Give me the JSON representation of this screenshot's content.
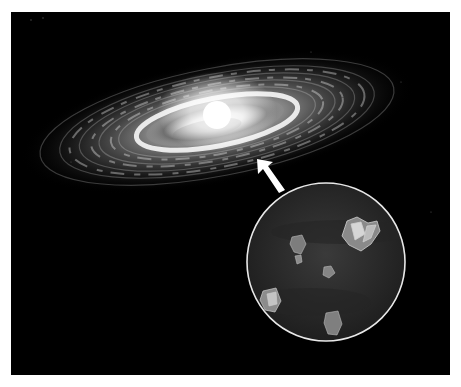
{
  "figure": {
    "background_color": "#000000",
    "inset": {
      "label": "magnified-dust-grains",
      "border_color": "#e8e8e8",
      "grain_count": 6
    },
    "arrow": {
      "color": "#ffffff",
      "direction": "up-left"
    }
  }
}
